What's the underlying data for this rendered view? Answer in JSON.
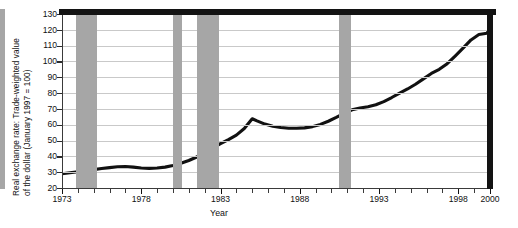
{
  "chart_data": {
    "type": "line",
    "title": "",
    "subtitle": "",
    "xlabel": "Year",
    "ylabel": "Real exchange rate: Trade-weighted value of the dollar (January 1997 = 100)",
    "ylabel_line1": "Real exchange rate: Trade-weighted value",
    "ylabel_line2": "of the dollar (January 1997 = 100)",
    "xlim": [
      1973,
      2000
    ],
    "ylim": [
      20,
      130
    ],
    "grid": true,
    "legend": "none",
    "y_ticks": [
      20,
      30,
      40,
      50,
      60,
      70,
      80,
      90,
      100,
      110,
      120,
      130
    ],
    "y_tick_labels": [
      "20",
      "30",
      "40",
      "50",
      "60",
      "70",
      "80",
      "90",
      "100",
      "110",
      "120",
      "130"
    ],
    "x_ticks": [
      1973,
      1974,
      1975,
      1976,
      1977,
      1978,
      1979,
      1980,
      1981,
      1982,
      1983,
      1984,
      1985,
      1986,
      1987,
      1988,
      1989,
      1990,
      1991,
      1992,
      1993,
      1994,
      1995,
      1996,
      1997,
      1998,
      1999,
      2000
    ],
    "x_tick_labels": [
      {
        "x": 1973,
        "label": "1973"
      },
      {
        "x": 1978,
        "label": "1978"
      },
      {
        "x": 1983,
        "label": "1983"
      },
      {
        "x": 1988,
        "label": "1988"
      },
      {
        "x": 1993,
        "label": "1993"
      },
      {
        "x": 1998,
        "label": "1998"
      },
      {
        "x": 2000,
        "label": "2000"
      }
    ],
    "series": [
      {
        "name": "Real exchange rate",
        "color": "#111111",
        "x": [
          1973.0,
          1973.5,
          1974.0,
          1974.5,
          1975.0,
          1975.5,
          1976.0,
          1976.5,
          1977.0,
          1977.5,
          1978.0,
          1978.5,
          1979.0,
          1979.5,
          1980.0,
          1980.5,
          1981.0,
          1981.5,
          1982.0,
          1982.5,
          1983.0,
          1983.5,
          1984.0,
          1984.5,
          1985.0,
          1985.3,
          1985.8,
          1986.3,
          1986.8,
          1987.3,
          1987.8,
          1988.3,
          1988.8,
          1989.3,
          1989.8,
          1990.3,
          1990.8,
          1991.3,
          1991.8,
          1992.3,
          1992.8,
          1993.3,
          1993.8,
          1994.3,
          1994.8,
          1995.3,
          1995.8,
          1996.3,
          1996.8,
          1997.3,
          1997.8,
          1998.3,
          1998.8,
          1999.3,
          1999.8,
          2000.0
        ],
        "y": [
          29.0,
          29.6,
          30.3,
          31.0,
          31.6,
          32.3,
          32.9,
          33.4,
          33.6,
          33.2,
          32.6,
          32.4,
          32.6,
          33.2,
          34.2,
          35.6,
          37.4,
          39.6,
          42.2,
          45.2,
          48.0,
          50.6,
          53.4,
          57.6,
          63.8,
          62.4,
          60.4,
          59.0,
          58.2,
          57.8,
          57.8,
          58.0,
          58.8,
          60.2,
          62.2,
          64.6,
          67.2,
          69.4,
          70.6,
          71.4,
          72.6,
          74.6,
          77.2,
          80.0,
          82.6,
          85.6,
          89.0,
          92.4,
          95.0,
          98.6,
          103.4,
          108.4,
          113.6,
          117.0,
          117.8,
          120.4
        ]
      }
    ],
    "shaded_bands": [
      {
        "name": "recession-1973-1975",
        "start": 1973.9,
        "end": 1975.2
      },
      {
        "name": "recession-1980",
        "start": 1980.0,
        "end": 1980.55
      },
      {
        "name": "recession-1981-1982",
        "start": 1981.5,
        "end": 1982.9
      },
      {
        "name": "recession-1990-1991",
        "start": 1990.5,
        "end": 1991.2
      }
    ],
    "band_color": "#a6a6a6",
    "line_color": "#111111",
    "grid_color": "#c9c9c9",
    "frame_color": "#131313"
  }
}
